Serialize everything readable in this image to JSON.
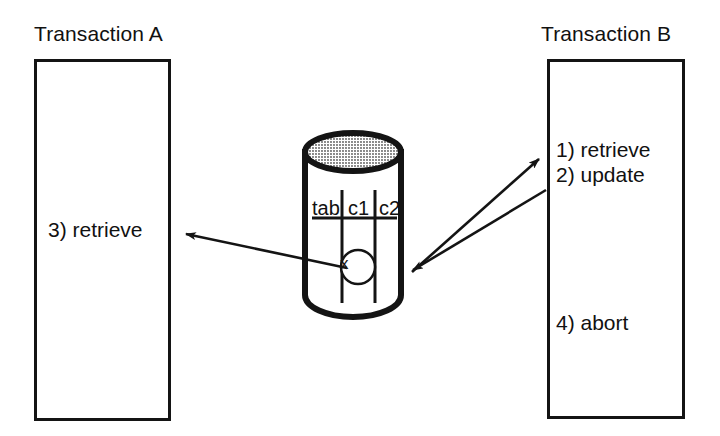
{
  "diagram": {
    "title_left": "Transaction A",
    "title_right": "Transaction B",
    "transaction_a": {
      "steps": [
        "3) retrieve"
      ]
    },
    "transaction_b": {
      "steps": [
        "1) retrieve",
        "2) update",
        "4) abort"
      ]
    },
    "database": {
      "shape": "cylinder",
      "table_header": [
        "tab",
        "c1",
        "c2"
      ],
      "row_value": "x"
    },
    "arrows": [
      {
        "name": "db-to-transaction-a",
        "label": "",
        "direction": "left"
      },
      {
        "name": "db-to-transaction-b",
        "label": "",
        "direction": "right"
      },
      {
        "name": "transaction-b-to-db",
        "label": "",
        "direction": "left-down"
      }
    ],
    "colors": {
      "stroke": "#141414",
      "fill": "#ffffff",
      "db_top_fill": "#c9c9c9"
    }
  }
}
